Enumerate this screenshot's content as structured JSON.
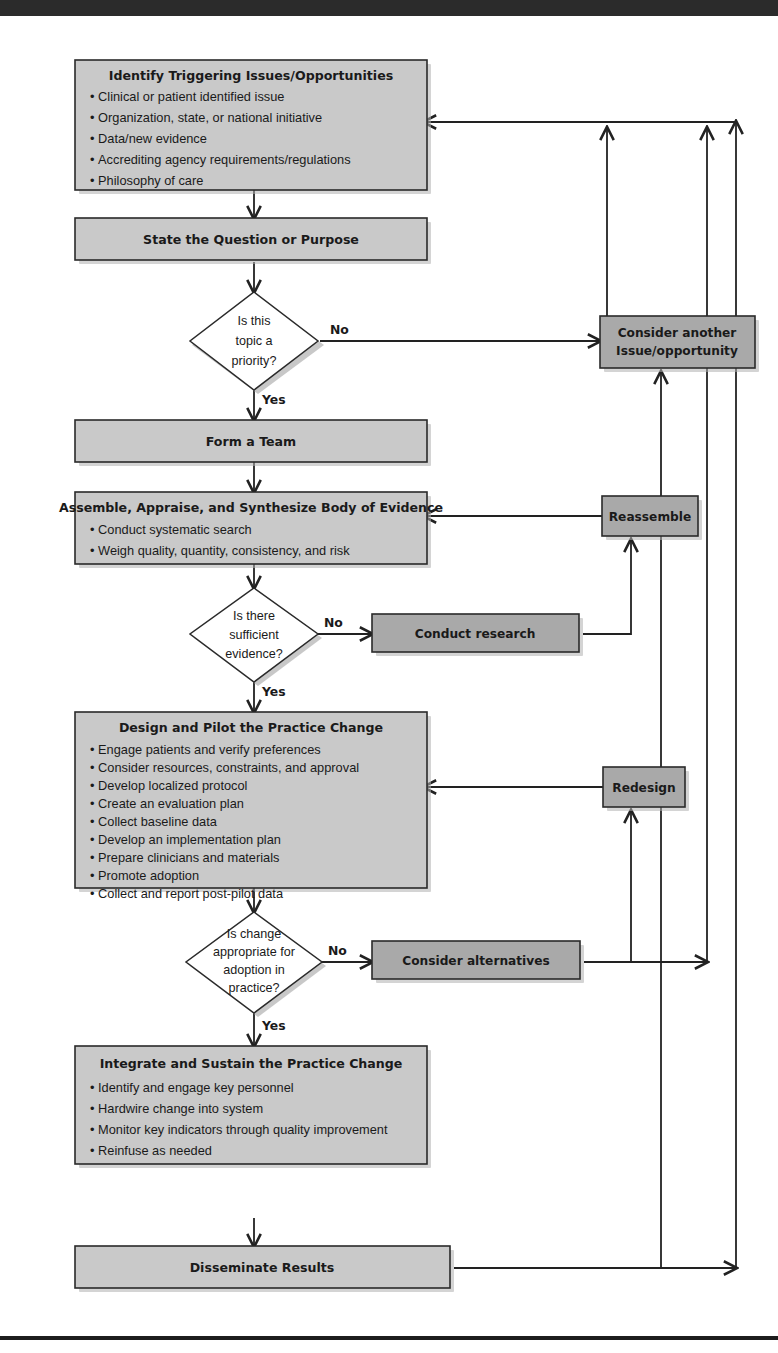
{
  "diagram": {
    "colors": {
      "node_fill": "#c9c9c9",
      "alt_node_fill": "#a9a9a9",
      "line": "#222222",
      "text": "#1a1a1a",
      "decision_fill": "#ffffff",
      "top_rule": "#2b2b2b"
    }
  },
  "nodes": {
    "identify": {
      "heading": "Identify Triggering Issues/Opportunities",
      "bullets": [
        "Clinical or patient identified issue",
        "Organization, state, or national initiative",
        "Data/new evidence",
        "Accrediting agency requirements/regulations",
        "Philosophy of care"
      ]
    },
    "state_question": {
      "heading": "State the Question or Purpose"
    },
    "form_team": {
      "heading": "Form a Team"
    },
    "assemble": {
      "heading": "Assemble, Appraise, and Synthesize Body of Evidence",
      "bullets": [
        "Conduct systematic search",
        "Weigh quality, quantity, consistency, and risk"
      ]
    },
    "design_pilot": {
      "heading": "Design and Pilot the Practice Change",
      "bullets": [
        "Engage patients and verify preferences",
        "Consider resources, constraints, and approval",
        "Develop localized protocol",
        "Create an evaluation plan",
        "Collect baseline data",
        "Develop an implementation plan",
        "Prepare clinicians and materials",
        "Promote adoption",
        "Collect and report post-pilot data"
      ]
    },
    "integrate": {
      "heading": "Integrate and Sustain the Practice Change",
      "bullets": [
        "Identify and engage key personnel",
        "Hardwire change into system",
        "Monitor key indicators through quality improvement",
        "Reinfuse as needed"
      ]
    },
    "disseminate": {
      "heading": "Disseminate Results"
    },
    "consider_another": {
      "line1": "Consider another",
      "line2": "Issue/opportunity"
    },
    "reassemble": {
      "label": "Reassemble"
    },
    "conduct_research": {
      "label": "Conduct research"
    },
    "redesign": {
      "label": "Redesign"
    },
    "consider_alternatives": {
      "label": "Consider alternatives"
    }
  },
  "decisions": {
    "priority": {
      "lines": [
        "Is this",
        "topic a",
        "priority?"
      ]
    },
    "evidence": {
      "lines": [
        "Is there",
        "sufficient",
        "evidence?"
      ]
    },
    "adoption": {
      "lines": [
        "Is change",
        "appropriate for",
        "adoption in",
        "practice?"
      ]
    }
  },
  "edges": {
    "priority_no": "No",
    "priority_yes": "Yes",
    "evidence_no": "No",
    "evidence_yes": "Yes",
    "adoption_no": "No",
    "adoption_yes": "Yes"
  }
}
